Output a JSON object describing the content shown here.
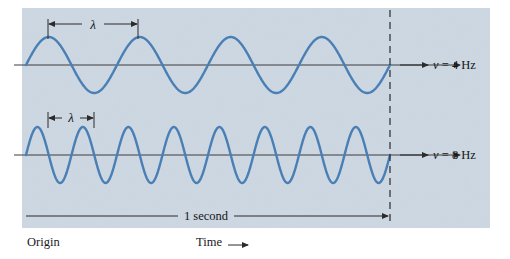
{
  "figure": {
    "background_color": "#ffffff",
    "panel_color": "#ccd7e2",
    "wave_color": "#4a7fb5",
    "axis_color": "#3c3c3c",
    "text_color": "#1a1a1a",
    "panel": {
      "x": 22,
      "y": 8,
      "width": 468,
      "height": 220
    }
  },
  "labels": {
    "origin": "Origin",
    "time": "Time",
    "time_arrow": "⟶",
    "duration": "1 second",
    "lambda": "λ"
  },
  "waves": [
    {
      "name": "wave-4hz",
      "frequency_symbol": "ν",
      "frequency_equals": "=",
      "frequency_value": "4",
      "frequency_unit": "Hz",
      "frequency_label": "ν = 4 Hz",
      "cycles_per_second": 4,
      "baseline_y": 65,
      "amplitude": 28,
      "wavelength_label": "λ"
    },
    {
      "name": "wave-8hz",
      "frequency_symbol": "ν",
      "frequency_equals": "=",
      "frequency_value": "8",
      "frequency_unit": "Hz",
      "frequency_label": "ν = 8 Hz",
      "cycles_per_second": 8,
      "baseline_y": 155,
      "amplitude": 28,
      "wavelength_label": "λ"
    }
  ],
  "chart_data": {
    "type": "line",
    "xlabel": "Time",
    "ylabel": "",
    "xlim": [
      0,
      1
    ],
    "x_unit": "second",
    "grid": false,
    "legend": "right-of-axes",
    "annotations": [
      {
        "text": "λ",
        "target": "wave-4hz",
        "span": "one wavelength, peak to peak"
      },
      {
        "text": "λ",
        "target": "wave-8hz",
        "span": "one wavelength, peak to peak"
      },
      {
        "text": "1 second",
        "target": "time-axis",
        "span": "origin to dashed marker"
      },
      {
        "text": "Origin",
        "target": "x-axis-start"
      },
      {
        "text": "Time ⟶",
        "target": "x-axis"
      }
    ],
    "series": [
      {
        "name": "ν = 4 Hz",
        "frequency_hz": 4,
        "amplitude": 1,
        "wavelength_fraction_of_second": 0.25,
        "cycles_shown": 4
      },
      {
        "name": "ν = 8 Hz",
        "frequency_hz": 8,
        "amplitude": 1,
        "wavelength_fraction_of_second": 0.125,
        "cycles_shown": 8
      }
    ]
  }
}
